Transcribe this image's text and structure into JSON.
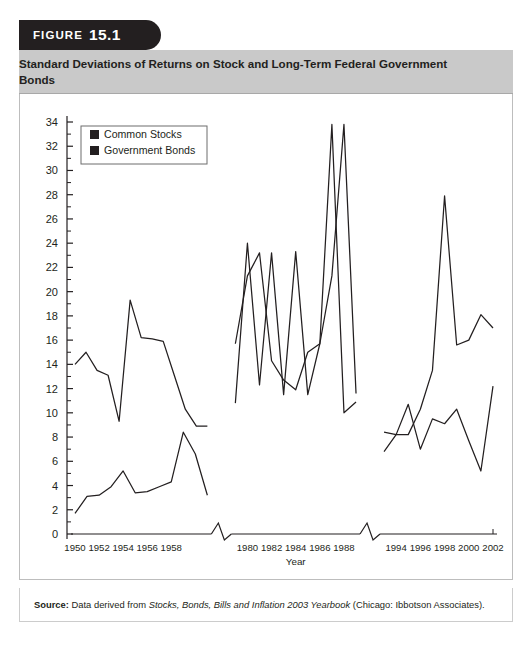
{
  "figure": {
    "label_word": "FIGURE",
    "number": "15.1",
    "title": "Standard Deviations of Returns on Stock and Long-Term Federal Government Bonds"
  },
  "source": {
    "label": "Source:",
    "lead": "Data derived from",
    "italic_title": "Stocks, Bonds, Bills and Inflation 2003 Yearbook",
    "tail": "(Chicago: Ibbotson Associates)."
  },
  "colors": {
    "tab_background": "#231f20",
    "title_band": "#c9c9c9",
    "line": "#231f20",
    "frame": "#bdbdbd",
    "text": "#231f20"
  },
  "chart_data": {
    "type": "line",
    "title": "Standard Deviations of Returns on Stock and Long-Term Federal Government Bonds",
    "xlabel": "Year",
    "ylabel": "",
    "ylim": [
      0,
      34
    ],
    "ytick_step": 2,
    "yticks": [
      0,
      2,
      4,
      6,
      8,
      10,
      12,
      14,
      16,
      18,
      20,
      22,
      24,
      26,
      28,
      30,
      32,
      34
    ],
    "grid": false,
    "axis_breaks": 2,
    "legend_position": "top-left",
    "legend": [
      "Common Stocks",
      "Government Bonds"
    ],
    "segments": [
      {
        "name": "1950s",
        "x": [
          1950,
          1951,
          1952,
          1953,
          1954,
          1955,
          1956,
          1957,
          1958,
          1959,
          1960,
          1961
        ],
        "xtick_labels": [
          "1950",
          "1952",
          "1954",
          "1956",
          "1958"
        ],
        "xtick_values": [
          1950,
          1952,
          1954,
          1956,
          1958
        ],
        "series": [
          {
            "name": "Common Stocks",
            "values": [
              14.0,
              15.0,
              13.5,
              13.1,
              9.3,
              19.3,
              16.2,
              16.1,
              15.9,
              13.1,
              10.3,
              8.9,
              8.9
            ]
          },
          {
            "name": "Government Bonds",
            "values": [
              1.7,
              3.1,
              3.2,
              3.9,
              5.2,
              3.4,
              3.5,
              3.9,
              4.3,
              8.4,
              6.6,
              3.2
            ]
          }
        ]
      },
      {
        "name": "1980s",
        "x": [
          1979,
          1980,
          1981,
          1982,
          1983,
          1984,
          1985,
          1986,
          1987,
          1988,
          1989
        ],
        "xtick_labels": [
          "1980",
          "1982",
          "1984",
          "1986",
          "1988"
        ],
        "xtick_values": [
          1980,
          1982,
          1984,
          1986,
          1988
        ],
        "series": [
          {
            "name": "Common Stocks",
            "values": [
              10.8,
              24.0,
              12.3,
              23.2,
              11.5,
              23.3,
              11.5,
              15.7,
              33.8,
              10.0,
              10.9
            ]
          },
          {
            "name": "Government Bonds",
            "values": [
              15.7,
              21.3,
              23.2,
              14.3,
              12.7,
              11.9,
              15.0,
              15.7,
              21.3,
              33.8,
              11.6
            ]
          }
        ]
      },
      {
        "name": "1990s-2000s",
        "x": [
          1993,
          1994,
          1995,
          1996,
          1997,
          1998,
          1999,
          2000,
          2001,
          2002
        ],
        "xtick_labels": [
          "1994",
          "1996",
          "1998",
          "2000",
          "2002"
        ],
        "xtick_values": [
          1994,
          1996,
          1998,
          2000,
          2002
        ],
        "series": [
          {
            "name": "Common Stocks",
            "values": [
              6.8,
              8.2,
              8.2,
              10.3,
              13.5,
              27.9,
              15.6,
              16.0,
              18.1,
              17.0
            ]
          },
          {
            "name": "Government Bonds",
            "values": [
              8.4,
              8.2,
              10.7,
              7.0,
              9.5,
              9.1,
              10.3,
              7.7,
              5.2,
              12.2
            ]
          }
        ]
      }
    ]
  }
}
